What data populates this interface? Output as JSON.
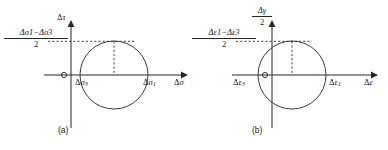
{
  "figure": {
    "background": "#ffffff",
    "stroke_color": "#262626",
    "curve_color": "#3c3c3c"
  },
  "panel_a": {
    "caption": "(a)",
    "origin_label": "O",
    "y_axis_label": {
      "delta": "Δ",
      "symbol": "τ"
    },
    "x_axis_label": {
      "delta": "Δ",
      "symbol": "σ"
    },
    "left_point_label": {
      "delta": "Δ",
      "symbol": "σ",
      "sub": "3"
    },
    "right_point_label": {
      "delta": "Δ",
      "symbol": "σ",
      "sub": "1"
    },
    "radius_label": {
      "numerator_a": {
        "delta": "Δ",
        "symbol": "σ",
        "sub": "1"
      },
      "operator": "−",
      "numerator_b": {
        "delta": "Δ",
        "symbol": "σ",
        "sub": "3"
      },
      "denominator": "2"
    }
  },
  "panel_b": {
    "caption": "(b)",
    "origin_label": "O",
    "y_axis_label": {
      "numerator": {
        "delta": "Δ",
        "symbol": "γ"
      },
      "denominator": "2"
    },
    "x_axis_label": {
      "delta": "Δ",
      "symbol": "ε"
    },
    "left_point_label": {
      "delta": "Δ",
      "symbol": "ε",
      "sub": "3"
    },
    "right_point_label": {
      "delta": "Δ",
      "symbol": "ε",
      "sub": "1"
    },
    "radius_label": {
      "numerator_a": {
        "delta": "Δ",
        "symbol": "ε",
        "sub": "1"
      },
      "operator": "−",
      "numerator_b": {
        "delta": "Δ",
        "symbol": "ε",
        "sub": "3"
      },
      "denominator": "2"
    }
  },
  "geometry": {
    "panel_a": {
      "axis_y": 75,
      "y_axis_x": 71,
      "circle_cx": 114,
      "circle_cy": 75,
      "circle_r": 34,
      "x_axis_start": 44,
      "x_axis_end": 186,
      "y_axis_top": 22,
      "y_axis_bottom": 128,
      "dash_h_start": 48,
      "dash_top_y": 41
    },
    "panel_b": {
      "axis_y": 75,
      "y_axis_x": 272,
      "circle_cx": 292,
      "circle_cy": 75,
      "circle_r": 34,
      "x_axis_start": 232,
      "x_axis_end": 376,
      "y_axis_top": 22,
      "y_axis_bottom": 128,
      "dash_h_start": 236,
      "dash_top_y": 41
    }
  }
}
